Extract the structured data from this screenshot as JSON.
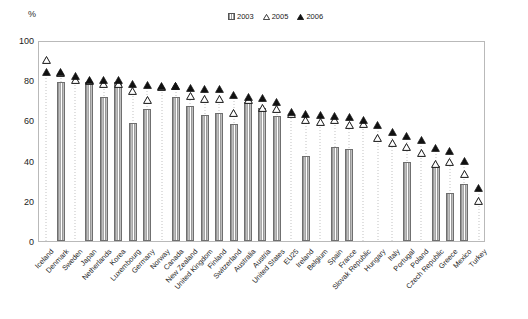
{
  "axis": {
    "unit_label": "%",
    "y_ticks": [
      0,
      20,
      40,
      60,
      80,
      100
    ],
    "ylim": [
      0,
      100
    ]
  },
  "legend": {
    "items": [
      {
        "label": "2003",
        "marker": "hollow-square-icon"
      },
      {
        "label": "2005",
        "marker": "hollow-triangle-icon"
      },
      {
        "label": "2006",
        "marker": "filled-triangle-icon"
      }
    ]
  },
  "chart_data": {
    "type": "bar",
    "title": "",
    "subtitle": "",
    "xlabel": "",
    "ylabel": "%",
    "ylim": [
      0,
      100
    ],
    "grid": false,
    "legend_position": "top-center",
    "categories": [
      "Iceland",
      "Denmark",
      "Sweden",
      "Japan",
      "Netherlands",
      "Korea",
      "Luxembourg",
      "Germany",
      "Norway",
      "Canada",
      "New Zealand",
      "United Kingdom",
      "Finland",
      "Switzerland",
      "Australia",
      "Austria",
      "United States",
      "EU25",
      "Ireland",
      "Belgium",
      "Spain",
      "France",
      "Slovak Republic",
      "Hungary",
      "Italy",
      "Portugal",
      "Poland",
      "Czech Republic",
      "Greece",
      "Mexico",
      "Turkey"
    ],
    "series": [
      {
        "name": "2003",
        "marker": "hollow-square-icon",
        "values": [
          null,
          79,
          null,
          79,
          71.5,
          79,
          58.5,
          65.5,
          null,
          71.5,
          67,
          62.5,
          63.5,
          58,
          69,
          66,
          62,
          null,
          42.5,
          null,
          47,
          46,
          null,
          null,
          null,
          39.5,
          null,
          37.5,
          24,
          28.5,
          null
        ]
      },
      {
        "name": "2005",
        "marker": "hollow-triangle-icon",
        "values": [
          90,
          83.5,
          80,
          79.5,
          78,
          78,
          74.5,
          70,
          76.5,
          77,
          72,
          70.5,
          70.5,
          63.5,
          70,
          66,
          65.5,
          63,
          60,
          59,
          60,
          57.5,
          58,
          51.5,
          49,
          47,
          44,
          38.5,
          39.5,
          33.5,
          20
        ]
      },
      {
        "name": "2006",
        "marker": "filled-triangle-icon",
        "values": [
          84,
          84,
          82,
          80,
          80,
          80,
          78,
          77.5,
          77,
          77,
          76,
          75.5,
          75.5,
          72.5,
          71.5,
          71,
          69,
          64,
          63,
          62.5,
          62,
          61.5,
          60,
          57.5,
          54,
          52,
          50.5,
          46.5,
          45,
          40,
          26.5
        ]
      }
    ]
  }
}
